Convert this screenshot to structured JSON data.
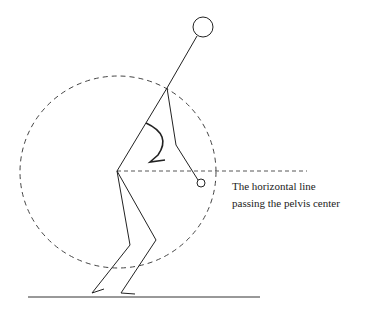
{
  "annotation": {
    "line1": "The horizontal line",
    "line2": "passing the pelvis center"
  },
  "figure": {
    "stroke_color": "#222222",
    "dash_color": "#444444"
  }
}
